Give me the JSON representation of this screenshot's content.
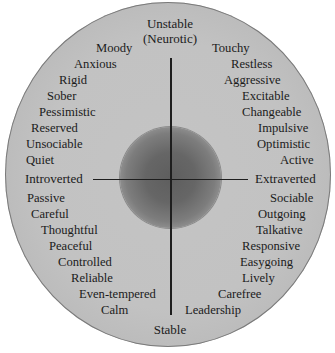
{
  "diagram": {
    "type": "personality-circle",
    "axes": {
      "top": "Unstable",
      "top_sub": "(Neurotic)",
      "bottom": "Stable",
      "left": "Introverted",
      "right": "Extraverted"
    },
    "quadrants": {
      "upper_left": [
        "Moody",
        "Anxious",
        "Rigid",
        "Sober",
        "Pessimistic",
        "Reserved",
        "Unsociable",
        "Quiet"
      ],
      "upper_right": [
        "Touchy",
        "Restless",
        "Aggressive",
        "Excitable",
        "Changeable",
        "Impulsive",
        "Optimistic",
        "Active"
      ],
      "lower_left": [
        "Passive",
        "Careful",
        "Thoughtful",
        "Peaceful",
        "Controlled",
        "Reliable",
        "Even-tempered",
        "Calm"
      ],
      "lower_right": [
        "Sociable",
        "Outgoing",
        "Talkative",
        "Responsive",
        "Easygoing",
        "Lively",
        "Carefree",
        "Leadership"
      ]
    },
    "colors": {
      "outer_fill": "#c2c2c2",
      "inner_core": "#5e5e5e",
      "lines": "#1e1e1e",
      "text": "#1b1b1b"
    }
  }
}
